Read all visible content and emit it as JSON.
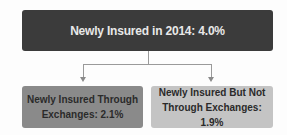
{
  "diagram": {
    "top": {
      "label": "Newly Insured in 2014:  4.0%"
    },
    "left": {
      "line1": "Newly Insured Through",
      "line2": "Exchanges:  2.1%"
    },
    "right": {
      "line1": "Newly Insured But Not",
      "line2": "Through Exchanges:  1.9%"
    }
  }
}
